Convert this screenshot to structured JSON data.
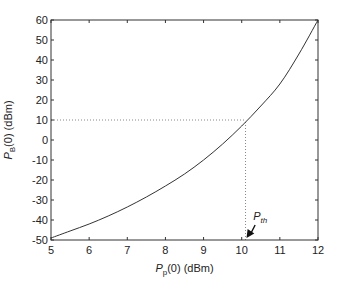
{
  "chart_data": {
    "type": "line",
    "title": "",
    "xlabel": "P_p(0) (dBm)",
    "ylabel": "P_B(0) (dBm)",
    "xlabel_parts": {
      "main": "P",
      "sub": "p",
      "rest": "(0) (dBm)"
    },
    "ylabel_parts": {
      "main": "P",
      "sub": "B",
      "rest": "(0) (dBm)"
    },
    "xlim": [
      5,
      12
    ],
    "ylim": [
      -50,
      60
    ],
    "xticks": [
      5,
      6,
      7,
      8,
      9,
      10,
      11,
      12
    ],
    "yticks": [
      -50,
      -40,
      -30,
      -20,
      -10,
      0,
      10,
      20,
      30,
      40,
      50,
      60
    ],
    "grid": false,
    "legend": null,
    "series": [
      {
        "name": "P_B(0) vs P_p(0)",
        "x": [
          5.0,
          5.5,
          6.0,
          6.5,
          7.0,
          7.5,
          8.0,
          8.5,
          9.0,
          9.5,
          10.0,
          10.5,
          11.0,
          11.5,
          12.0
        ],
        "y": [
          -49,
          -45.5,
          -42,
          -38,
          -33.5,
          -28.5,
          -23,
          -17,
          -10,
          -2,
          7,
          17,
          28,
          43,
          60
        ]
      }
    ],
    "reference_lines": [
      {
        "type": "horizontal",
        "y": 10,
        "x_from": 5,
        "x_to": 10.1,
        "style": "dotted"
      },
      {
        "type": "vertical",
        "x": 10.1,
        "y_from": -50,
        "y_to": 10,
        "style": "dotted"
      }
    ],
    "annotations": [
      {
        "text_main": "P",
        "text_sub": "th",
        "label": "P_th",
        "x_text": 10.3,
        "y_text": -40,
        "arrow_to": [
          10.1,
          -50
        ]
      }
    ]
  },
  "colors": {
    "axis": "#333333",
    "curve": "#333333",
    "dotted": "#888888",
    "background": "#ffffff"
  }
}
